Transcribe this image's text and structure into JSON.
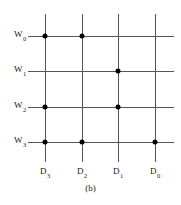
{
  "figure": {
    "caption": "(b)",
    "type": "grid-diagram"
  },
  "axes": {
    "row_labels": [
      "W0",
      "W1",
      "W2",
      "W3"
    ],
    "row_label_base": [
      "W",
      "W",
      "W",
      "W"
    ],
    "row_label_sub": [
      "0",
      "1",
      "2",
      "3"
    ],
    "col_labels": [
      "D3",
      "D2",
      "D1",
      "D0"
    ],
    "col_label_base": [
      "D",
      "D",
      "D",
      "D"
    ],
    "col_label_sub": [
      "3",
      "2",
      "1",
      "0"
    ]
  },
  "colors": {
    "line": "#555555",
    "dot": "#000000",
    "text": "#1a1a1a",
    "background": "#ffffff"
  },
  "geometry": {
    "col_x": [
      45,
      82,
      118,
      155
    ],
    "row_y": [
      36,
      71,
      107,
      142
    ],
    "vline_top": 14,
    "vline_bottom": 162,
    "hline_left": 28,
    "hline_right": 174
  },
  "chart_data": {
    "type": "heatmap",
    "title": "(b)",
    "xlabel": "",
    "ylabel": "",
    "categories": [
      "D3",
      "D2",
      "D1",
      "D0"
    ],
    "rows": [
      "W0",
      "W1",
      "W2",
      "W3"
    ],
    "series": [
      {
        "name": "W0",
        "values": [
          1,
          1,
          0,
          0
        ]
      },
      {
        "name": "W1",
        "values": [
          0,
          0,
          1,
          0
        ]
      },
      {
        "name": "W2",
        "values": [
          1,
          0,
          1,
          0
        ]
      },
      {
        "name": "W3",
        "values": [
          1,
          1,
          0,
          1
        ]
      }
    ],
    "nodes": [
      {
        "row": "W0",
        "col": "D3"
      },
      {
        "row": "W0",
        "col": "D2"
      },
      {
        "row": "W1",
        "col": "D1"
      },
      {
        "row": "W2",
        "col": "D3"
      },
      {
        "row": "W2",
        "col": "D1"
      },
      {
        "row": "W3",
        "col": "D3"
      },
      {
        "row": "W3",
        "col": "D2"
      },
      {
        "row": "W3",
        "col": "D0"
      }
    ],
    "grid": true,
    "legend": "none"
  }
}
